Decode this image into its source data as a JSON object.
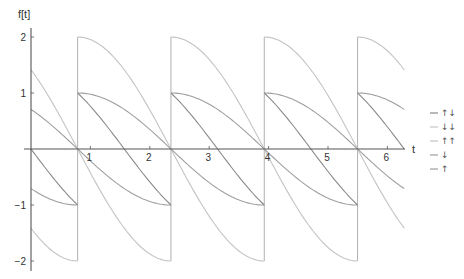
{
  "chart_data": {
    "type": "line",
    "title": "",
    "xlabel": "t",
    "ylabel": "f[t]",
    "xlim": [
      0,
      6.2832
    ],
    "ylim": [
      -2.2,
      2.2
    ],
    "x_ticks": [
      1,
      2,
      3,
      4,
      5,
      6
    ],
    "y_ticks": [
      -2,
      -1,
      1,
      2
    ],
    "grid": false,
    "legend_position": "right",
    "period": 1.5708,
    "phase_offset": 0.7854,
    "discontinuities": [
      0.7854,
      2.3562,
      3.927,
      5.4978
    ],
    "series": [
      {
        "name": "↑↓",
        "color": "#8a8a8a",
        "width": 1.1,
        "formula": "cos(u) - sin(u), u = (t + π/4) mod π/2",
        "x": [
          0,
          0.7854,
          0.7854,
          1.5708,
          2.3562,
          2.3562,
          3.1416,
          3.927,
          3.927,
          4.7124,
          5.4978,
          5.4978,
          6.2832
        ],
        "values": [
          0,
          -1,
          1,
          0,
          -1,
          1,
          0,
          -1,
          1,
          0,
          -1,
          1,
          0
        ]
      },
      {
        "name": "↓↓",
        "color": "#c4c4c4",
        "width": 1.1,
        "formula": "-2 sin(u)",
        "x": [
          0,
          0.7854,
          0.7854,
          1.5708,
          2.3562,
          2.3562,
          3.1416,
          3.927,
          3.927,
          4.7124,
          5.4978,
          5.4978,
          6.2832
        ],
        "values": [
          -1.414,
          -2,
          0,
          -1.414,
          -2,
          0,
          -1.414,
          -2,
          0,
          -1.414,
          -2,
          0,
          -1.414
        ]
      },
      {
        "name": "↑↑",
        "color": "#c4c4c4",
        "width": 1.1,
        "formula": "2 cos(u)",
        "x": [
          0,
          0.7854,
          0.7854,
          1.5708,
          2.3562,
          2.3562,
          3.1416,
          3.927,
          3.927,
          4.7124,
          5.4978,
          5.4978,
          6.2832
        ],
        "values": [
          1.414,
          0,
          2,
          1.414,
          0,
          2,
          1.414,
          0,
          2,
          1.414,
          0,
          2,
          1.414
        ]
      },
      {
        "name": "↓",
        "color": "#9e9e9e",
        "width": 1.1,
        "formula": "-sin(u)",
        "x": [
          0,
          0.7854,
          0.7854,
          1.5708,
          2.3562,
          2.3562,
          3.1416,
          3.927,
          3.927,
          4.7124,
          5.4978,
          5.4978,
          6.2832
        ],
        "values": [
          -0.707,
          -1,
          0,
          -0.707,
          -1,
          0,
          -0.707,
          -1,
          0,
          -0.707,
          -1,
          0,
          -0.707
        ]
      },
      {
        "name": "↑",
        "color": "#9e9e9e",
        "width": 1.1,
        "formula": "cos(u)",
        "x": [
          0,
          0.7854,
          0.7854,
          1.5708,
          2.3562,
          2.3562,
          3.1416,
          3.927,
          3.927,
          4.7124,
          5.4978,
          5.4978,
          6.2832
        ],
        "values": [
          0.707,
          0,
          1,
          0.707,
          0,
          1,
          0.707,
          0,
          1,
          0.707,
          0,
          1,
          0.707
        ]
      }
    ]
  },
  "axes": {
    "x_label": "t",
    "y_label": "f[t]",
    "x_tick_labels": [
      "1",
      "2",
      "3",
      "4",
      "5",
      "6"
    ],
    "y_tick_labels": [
      "2",
      "1",
      "−1",
      "−2"
    ]
  },
  "legend": {
    "items": [
      {
        "label": "↑↓",
        "color": "#8a8a8a"
      },
      {
        "label": "↓↓",
        "color": "#c4c4c4"
      },
      {
        "label": "↑↑",
        "color": "#c4c4c4"
      },
      {
        "label": "↓",
        "color": "#9e9e9e"
      },
      {
        "label": "↑",
        "color": "#9e9e9e"
      }
    ]
  },
  "colors": {
    "axis": "#555555",
    "jump_lines": "#b0b0b0"
  }
}
